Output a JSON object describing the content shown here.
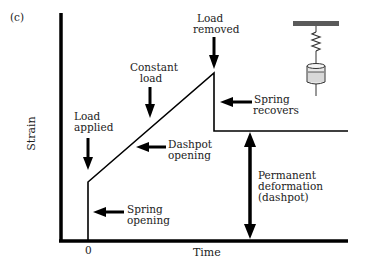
{
  "panel_label": "(c)",
  "axes": {
    "y_label": "Strain",
    "x_label": "Time",
    "x_origin_tick": "0"
  },
  "annotations": {
    "load_applied": [
      "Load",
      "applied"
    ],
    "constant_load": [
      "Constant",
      "load"
    ],
    "load_removed": [
      "Load",
      "removed"
    ],
    "spring_recovers": [
      "Spring",
      "recovers"
    ],
    "dashpot_opening": [
      "Dashpot",
      "opening"
    ],
    "spring_opening": [
      "Spring",
      "opening"
    ],
    "permanent_deformation": [
      "Permanent",
      "deformation",
      "(dashpot)"
    ]
  },
  "model_icon": {
    "name": "spring-dashpot-model",
    "components": [
      "fixed-support",
      "spring",
      "dashpot"
    ]
  },
  "curve": {
    "description": "Strain vs time for Maxwell (spring + dashpot in series) model",
    "points_px": [
      [
        88,
        241
      ],
      [
        88,
        182
      ],
      [
        214,
        73
      ],
      [
        214,
        131
      ],
      [
        348,
        131
      ]
    ]
  },
  "colors": {
    "line": "#000000",
    "text": "#222222",
    "background": "#ffffff",
    "support": "#5a5a5a",
    "dashpot_fill": "#d8d8d8"
  }
}
